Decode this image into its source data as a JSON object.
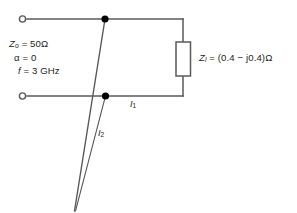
{
  "diagram": {
    "background_color": "#ffffff",
    "line_color": "#58595b",
    "text_color": "#231f20",
    "node_color": "#000000"
  },
  "parameters": {
    "characteristic_impedance": {
      "symbol": "Z",
      "subscript": "o",
      "equals": "=",
      "value": "50Ω"
    },
    "attenuation": {
      "symbol": "α",
      "equals": "=",
      "value": "0"
    },
    "frequency": {
      "symbol": "f",
      "equals": "=",
      "value": "3 GHz"
    }
  },
  "load": {
    "symbol": "Z",
    "subscript": "l",
    "equals": "=",
    "value": "(0.4 − j0.4)Ω"
  },
  "currents": {
    "main_line": {
      "symbol": "I",
      "subscript": "1"
    },
    "stub": {
      "symbol": "I",
      "subscript": "2"
    }
  },
  "terminals": {
    "top_input": "open-terminal",
    "bottom_input": "open-terminal"
  },
  "nodes": {
    "top_junction": "junction-dot",
    "bottom_junction": "junction-dot"
  },
  "components": {
    "load_resistor": "resistor-box",
    "stub": "shorted-stub"
  }
}
